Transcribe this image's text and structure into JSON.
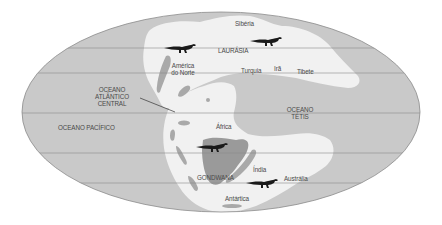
{
  "map": {
    "title": "Mapa paleogeográfico — Jurássico (Laurásia e Gondwana)",
    "projection": "elliptical (Mollweide-like)",
    "colors": {
      "ocean": "#c9c9c9",
      "land": "#f1f1f1",
      "highlight_land": "#9a9a9a",
      "inland_sea": "#a9a9a9",
      "gridline": "#8a8a8a",
      "outline": "#8c8c8c",
      "text": "#4a4a4a",
      "dinosaur": "#1a1a1a"
    },
    "supercontinents": {
      "north": "LAURÁSIA",
      "south": "GONDWANA"
    },
    "oceans": {
      "atlantic": [
        "OCEANO",
        "ATLÂNTICO",
        "CENTRAL"
      ],
      "tethys": [
        "OCEANO",
        "TÉTIS"
      ],
      "pacific": "OCEANO PACÍFICO"
    },
    "regions": {
      "siberia": "Sibéria",
      "north_america": [
        "América",
        "do Norte"
      ],
      "turkey": "Turquia",
      "iran": "Irã",
      "tibet": "Tibete",
      "africa": "África",
      "india": "Índia",
      "australia": "Austrália",
      "antarctica": "Antártica"
    },
    "dinosaur_markers": [
      {
        "name": "dinosaur-north-america",
        "x": 165,
        "y": 48
      },
      {
        "name": "dinosaur-laurasia-east",
        "x": 250,
        "y": 40
      },
      {
        "name": "dinosaur-africa",
        "x": 195,
        "y": 148
      },
      {
        "name": "dinosaur-australia",
        "x": 245,
        "y": 185
      }
    ]
  }
}
